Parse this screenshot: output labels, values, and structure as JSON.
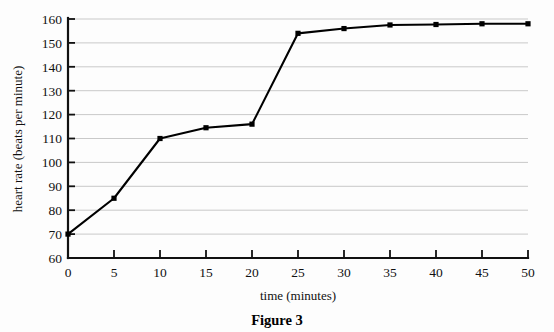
{
  "figure": {
    "caption": "Figure 3"
  },
  "chart_data": {
    "type": "line",
    "title": "",
    "xlabel": "time (minutes)",
    "ylabel": "heart rate (beats per minute)",
    "xlim": [
      0,
      50
    ],
    "ylim": [
      60,
      160
    ],
    "xticks": [
      0,
      5,
      10,
      15,
      20,
      25,
      30,
      35,
      40,
      45,
      50
    ],
    "yticks": [
      60,
      70,
      80,
      90,
      100,
      110,
      120,
      130,
      140,
      150,
      160
    ],
    "grid": "horizontal",
    "legend": "none",
    "x": [
      0,
      5,
      10,
      15,
      20,
      25,
      30,
      35,
      40,
      45,
      50
    ],
    "values": [
      70,
      85,
      110,
      114.5,
      116,
      154,
      156,
      157.5,
      157.7,
      158,
      158
    ],
    "series": [
      {
        "name": "heart rate",
        "color": "#000000",
        "marker": "square",
        "values": [
          70,
          85,
          110,
          114.5,
          116,
          154,
          156,
          157.5,
          157.7,
          158,
          158
        ]
      }
    ],
    "colors": {
      "line": "#000000",
      "marker": "#000000",
      "grid": "#c9c9c9",
      "axis": "#111111",
      "background": "#fdfdfd"
    }
  }
}
